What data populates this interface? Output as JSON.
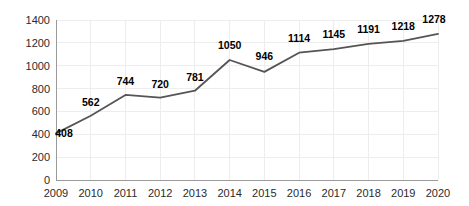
{
  "chart_data": {
    "type": "line",
    "title": "",
    "subtitle": "",
    "xlabel": "",
    "ylabel": "",
    "categories": [
      "2009",
      "2010",
      "2011",
      "2012",
      "2013",
      "2014",
      "2015",
      "2016",
      "2017",
      "2018",
      "2019",
      "2020"
    ],
    "values": [
      408,
      562,
      744,
      720,
      781,
      1050,
      946,
      1114,
      1145,
      1191,
      1218,
      1278
    ],
    "series": [
      {
        "name": "",
        "values": [
          408,
          562,
          744,
          720,
          781,
          1050,
          946,
          1114,
          1145,
          1191,
          1218,
          1278
        ]
      }
    ],
    "point_labels": [
      "408",
      "562",
      "744",
      "720",
      "781",
      "1050",
      "946",
      "1114",
      "1145",
      "1191",
      "1218",
      "1278"
    ],
    "y_ticks": [
      0,
      200,
      400,
      600,
      800,
      1000,
      1200,
      1400
    ],
    "y_tick_labels": [
      "0",
      "200",
      "400",
      "600",
      "800",
      "1000",
      "1200",
      "1400"
    ],
    "x_tick_labels": [
      "2009",
      "2010",
      "2011",
      "2012",
      "2013",
      "2014",
      "2015",
      "2016",
      "2017",
      "2018",
      "2019",
      "2020"
    ],
    "ylim": [
      0,
      1400
    ],
    "grid": true,
    "grid_color": "#ededed",
    "legend": false,
    "legend_position": "none",
    "line_color": "#555555",
    "label_color": "#000000",
    "axis_color": "#9a9a9a",
    "background_color": "#ffffff",
    "annotations": []
  }
}
